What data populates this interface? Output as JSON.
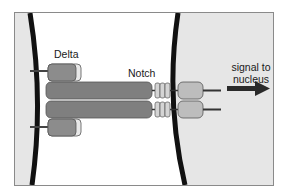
{
  "diagram": {
    "labels": {
      "delta": "Delta",
      "notch": "Notch",
      "signal_line1": "signal to",
      "signal_line2": "nucleus"
    },
    "elements": {
      "left_cell": "signal-sending cell (Delta expressing)",
      "right_cell": "signal-receiving cell (Notch expressing)",
      "delta_ligands": 2,
      "notch_receptors": 2,
      "egf_repeats_per_receptor": 3,
      "arrow_direction": "right"
    },
    "colors": {
      "cell_interior": "#e6e6e6",
      "membrane": "#111111",
      "delta_body": "#8c8c8c",
      "delta_cap": "#e8e8e8",
      "notch_extracellular": "#7f7f7f",
      "notch_repeats": "#d4d4d4",
      "notch_intracellular": "#bdbdbd",
      "arrow": "#2a2a2a",
      "frame_border": "#8a8a8a"
    }
  }
}
